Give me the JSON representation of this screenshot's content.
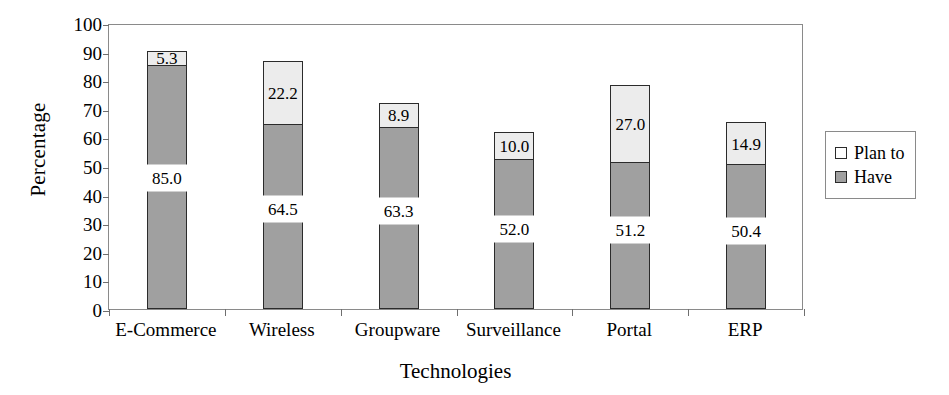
{
  "chart_data": {
    "type": "bar",
    "subtype": "stacked-column",
    "title": "",
    "xlabel": "Technologies",
    "ylabel": "Percentage",
    "ylim": [
      0,
      100
    ],
    "yticks": [
      0,
      10,
      20,
      30,
      40,
      50,
      60,
      70,
      80,
      90,
      100
    ],
    "ytick_labels": [
      "0",
      "10",
      "20",
      "30",
      "40",
      "50",
      "60",
      "70",
      "80",
      "90",
      "100"
    ],
    "grid": false,
    "legend_position": "right",
    "categories": [
      "E-Commerce",
      "Wireless",
      "Groupware",
      "Surveillance",
      "Portal",
      "ERP"
    ],
    "series": [
      {
        "name": "Have",
        "color": "#a0a0a0",
        "values": [
          85.0,
          64.5,
          63.3,
          52.0,
          51.2,
          50.4
        ],
        "labels": [
          "85.0",
          "64.5",
          "63.3",
          "52.0",
          "51.2",
          "50.4"
        ]
      },
      {
        "name": "Plan to",
        "color": "#ececec",
        "values": [
          5.3,
          22.2,
          8.9,
          10.0,
          27.0,
          14.9
        ],
        "labels": [
          "5.3",
          "22.2",
          "8.9",
          "10.0",
          "27.0",
          "14.9"
        ]
      }
    ],
    "totals": [
      90.3,
      86.7,
      72.2,
      62.0,
      78.2,
      65.3
    ]
  },
  "legend": {
    "entries": [
      {
        "label": "Plan to",
        "swatch": "plan"
      },
      {
        "label": "Have",
        "swatch": "have"
      }
    ]
  },
  "axes": {
    "y_title": "Percentage",
    "x_title": "Technologies"
  }
}
